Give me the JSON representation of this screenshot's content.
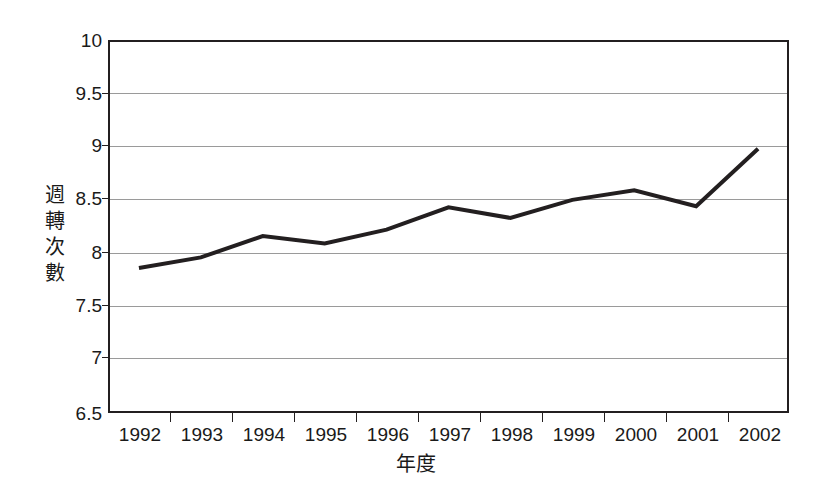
{
  "chart_data": {
    "type": "line",
    "title": "",
    "subtitle": "",
    "xlabel": "年度",
    "ylabel": "週轉次數",
    "categories": [
      "1992",
      "1993",
      "1994",
      "1995",
      "1996",
      "1997",
      "1998",
      "1999",
      "2000",
      "2001",
      "2002"
    ],
    "series": [
      {
        "name": "週轉次數",
        "values": [
          7.86,
          7.96,
          8.16,
          8.09,
          8.22,
          8.43,
          8.33,
          8.5,
          8.59,
          8.44,
          8.98
        ]
      }
    ],
    "ylim": [
      6.5,
      10
    ],
    "ytick_labels": [
      "10",
      "9.5",
      "9",
      "8.5",
      "8",
      "7.5",
      "7",
      "6.5"
    ],
    "ytick_values": [
      10,
      9.5,
      9,
      8.5,
      8,
      7.5,
      7,
      6.5
    ],
    "grid": true,
    "grid_axis": "y",
    "legend": false,
    "legend_position": "none",
    "line_color": "#231f20",
    "line_width": 4,
    "markers": false,
    "grid_color": "#9a9a9a",
    "axis_color": "#231f20",
    "background_color": "#ffffff",
    "text_color": "#1a1a1a"
  },
  "axis_titles": {
    "y_chars": [
      "週",
      "轉",
      "次",
      "數"
    ],
    "y_text": "週轉次數",
    "x_text": "年度"
  }
}
